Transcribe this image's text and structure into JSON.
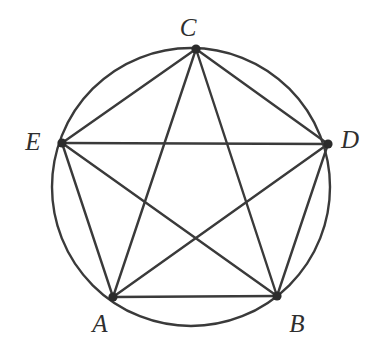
{
  "figure": {
    "type": "geometry-diagram",
    "canvas": {
      "width": 378,
      "height": 350
    },
    "background_color": "#ffffff",
    "stroke_color": "#3a3a3a",
    "line_width": 2.4,
    "dot_color": "#2b2b2b",
    "dot_radius": 4.6,
    "circle": {
      "name": "circumscribed-circle",
      "cx": 191,
      "cy": 187,
      "r": 139
    },
    "points": [
      {
        "id": "A",
        "label": "A",
        "x": 113,
        "y": 297,
        "label_x": 100,
        "label_y": 323
      },
      {
        "id": "B",
        "label": "B",
        "x": 277,
        "y": 296,
        "label_x": 297,
        "label_y": 323
      },
      {
        "id": "C",
        "label": "C",
        "x": 196,
        "y": 49,
        "label_x": 188,
        "label_y": 27
      },
      {
        "id": "D",
        "label": "D",
        "x": 328,
        "y": 144,
        "label_x": 350,
        "label_y": 139
      },
      {
        "id": "E",
        "label": "E",
        "x": 62,
        "y": 143,
        "label_x": 33,
        "label_y": 141
      }
    ],
    "chords": [
      {
        "name": "chord-AB",
        "from": "A",
        "to": "B"
      },
      {
        "name": "chord-AC",
        "from": "A",
        "to": "C"
      },
      {
        "name": "chord-AD",
        "from": "A",
        "to": "D"
      },
      {
        "name": "chord-AE",
        "from": "A",
        "to": "E"
      },
      {
        "name": "chord-BC",
        "from": "B",
        "to": "C"
      },
      {
        "name": "chord-BD",
        "from": "B",
        "to": "D"
      },
      {
        "name": "chord-BE",
        "from": "B",
        "to": "E"
      },
      {
        "name": "chord-CD",
        "from": "C",
        "to": "D"
      },
      {
        "name": "chord-CE",
        "from": "C",
        "to": "E"
      },
      {
        "name": "chord-DE",
        "from": "D",
        "to": "E"
      }
    ]
  }
}
